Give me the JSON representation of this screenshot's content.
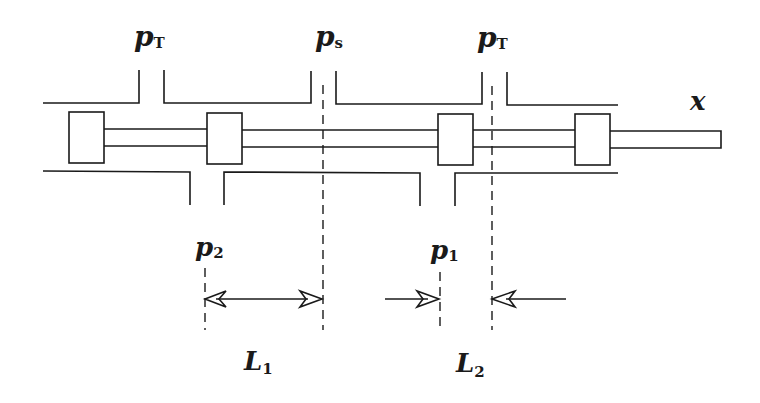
{
  "diagram": {
    "type": "spool-valve-schematic",
    "labels": {
      "tank_left": {
        "main": "p",
        "sub": "T"
      },
      "supply": {
        "main": "p",
        "sub": "s"
      },
      "tank_right": {
        "main": "p",
        "sub": "T"
      },
      "displacement": {
        "main": "x"
      },
      "port_2": {
        "main": "p",
        "sub": "2"
      },
      "port_1": {
        "main": "p",
        "sub": "1"
      },
      "length_1": {
        "main": "L",
        "sub": "1"
      },
      "length_2": {
        "main": "L",
        "sub": "2"
      }
    },
    "components": {
      "housing_top": "valve body upper wall with three ports (pT, ps, pT)",
      "housing_bottom": "valve body lower wall with two ports (p2, p1)",
      "spool": "spool rod with four lands",
      "dimension_L1": "double arrow between p2 edge and ps centerline",
      "dimension_L2": "inward arrows between p1 edge and pT centerline"
    },
    "colors": {
      "line": "#1a1a1a",
      "background": "#ffffff"
    }
  }
}
